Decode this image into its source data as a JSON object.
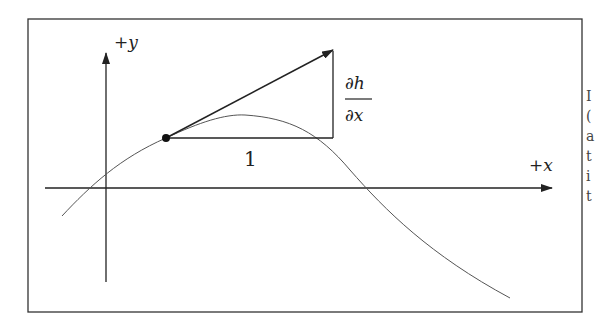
{
  "diagram": {
    "axes": {
      "y_label": "+y",
      "x_label": "+x"
    },
    "triangle": {
      "run_label": "1",
      "rise_numerator": "∂h",
      "rise_denominator": "∂x"
    },
    "curve": "sinusoidal h(x) passing through origin",
    "colors": {
      "line": "#222222",
      "curve": "#555555",
      "frame": "#333333",
      "background": "#ffffff"
    }
  },
  "edge_text_fragments": [
    "I",
    "(",
    "a",
    "t",
    "i",
    "t"
  ]
}
